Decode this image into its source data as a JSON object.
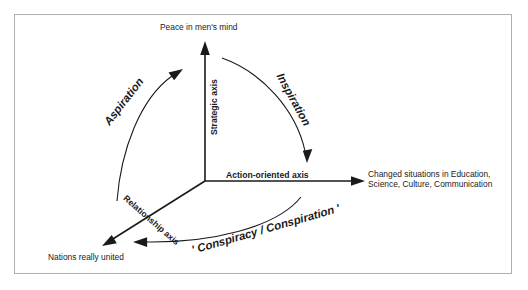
{
  "figure": {
    "background_color": "#ffffff",
    "border_color": "#aeaeae",
    "ink_color": "#1a1a1a"
  },
  "endpoints": {
    "top": "Peace in men's mind",
    "right": "Changed situations in Education, Science, Culture, Communication",
    "bottom_left": "Nations really united"
  },
  "axes": [
    {
      "id": "strategic",
      "label": "Strategic axis",
      "direction": "up"
    },
    {
      "id": "action-oriented",
      "label": "Action-oriented axis",
      "direction": "right"
    },
    {
      "id": "relationship",
      "label": "Relationship axis",
      "direction": "down-left"
    }
  ],
  "curves": [
    {
      "id": "aspiration",
      "label": "Aspiration",
      "from": "relationship axis",
      "to": "strategic axis"
    },
    {
      "id": "inspiration",
      "label": "Inspiration",
      "from": "strategic axis",
      "to": "action-oriented axis"
    },
    {
      "id": "conspiracy",
      "label": "' Conspiracy / Conspiration '",
      "from": "action-oriented axis",
      "to": "relationship axis"
    }
  ]
}
